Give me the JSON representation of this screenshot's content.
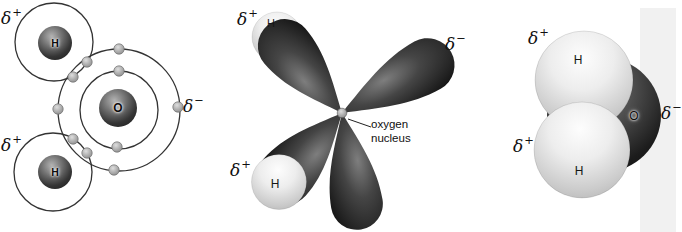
{
  "sym": {
    "delta": "δ",
    "plus": "+",
    "minus": "−"
  },
  "bohr": {
    "h_top": "H",
    "o": "O",
    "h_bottom": "H"
  },
  "orbital": {
    "h_top": "H",
    "h_bottom": "H",
    "caption_line1": "oxygen",
    "caption_line2": "nucleus"
  },
  "space_filling": {
    "h_top": "H",
    "o": "O",
    "h_bottom": "H"
  },
  "colors": {
    "background": "#ffffff",
    "shell_stroke": "#333333",
    "dark_sphere": "#3a3a3a",
    "light_sphere": "#d8d8d8",
    "lobe": "#1c1c1c",
    "electron": "#a9a9a9"
  }
}
